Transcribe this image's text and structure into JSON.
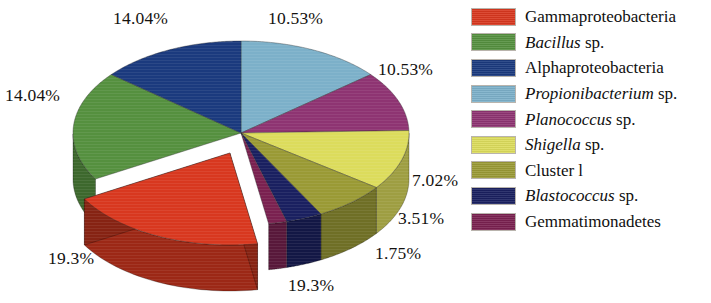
{
  "chart_data": {
    "type": "pie",
    "title": "",
    "subtitle": "",
    "xlabel": "",
    "ylabel": "",
    "three_d": true,
    "grid": false,
    "legend_position": "right",
    "exploded_slices": [
      "Gammaproteobacteria"
    ],
    "value_suffix": "%",
    "categories": [
      "Gammaproteobacteria",
      "Bacillus sp.",
      "Alphaproteobacteria",
      "Propionibacterium sp.",
      "Planococcus sp.",
      "Shigella sp.",
      "Cluster l",
      "Blastococcus sp.",
      "Gemmatimonadetes"
    ],
    "values": [
      19.3,
      19.3,
      14.04,
      14.04,
      10.53,
      10.53,
      7.02,
      3.51,
      1.75
    ],
    "colors": [
      "#d8381f",
      "#55903f",
      "#1b3a7e",
      "#7cb0c9",
      "#8e3472",
      "#dcdc5c",
      "#9a9a35",
      "#1a2060",
      "#7a2150"
    ],
    "data_labels": [
      "19.3%",
      "19.3%",
      "14.04%",
      "14.04%",
      "10.53%",
      "10.53%",
      "7.02%",
      "3.51%",
      "1.75%"
    ]
  },
  "pie": {
    "labels": [
      {
        "text": "14.04%",
        "left": 113,
        "top": 8
      },
      {
        "text": "10.53%",
        "left": 268,
        "top": 8
      },
      {
        "text": "10.53%",
        "left": 378,
        "top": 59
      },
      {
        "text": "14.04%",
        "left": 5,
        "top": 85
      },
      {
        "text": "7.02%",
        "left": 412,
        "top": 170
      },
      {
        "text": "3.51%",
        "left": 398,
        "top": 208
      },
      {
        "text": "1.75%",
        "left": 375,
        "top": 243
      },
      {
        "text": "19.3%",
        "left": 48,
        "top": 248
      },
      {
        "text": "19.3%",
        "left": 288,
        "top": 275
      }
    ]
  },
  "legend": {
    "items": [
      {
        "label_plain": "Gammaproteobacteria",
        "label_italic": "",
        "label_tail": "",
        "color": "#d8381f"
      },
      {
        "label_plain": "",
        "label_italic": "Bacillus",
        "label_tail": " sp.",
        "color": "#55903f"
      },
      {
        "label_plain": "Alphaproteobacteria",
        "label_italic": "",
        "label_tail": "",
        "color": "#1b3a7e"
      },
      {
        "label_plain": "",
        "label_italic": "Propionibacterium",
        "label_tail": " sp.",
        "color": "#7cb0c9"
      },
      {
        "label_plain": "",
        "label_italic": "Planococcus",
        "label_tail": " sp.",
        "color": "#8e3472"
      },
      {
        "label_plain": "",
        "label_italic": "Shigella",
        "label_tail": " sp.",
        "color": "#dcdc5c"
      },
      {
        "label_plain": "Cluster l",
        "label_italic": "",
        "label_tail": "",
        "color": "#9a9a35"
      },
      {
        "label_plain": "",
        "label_italic": "Blastococcus",
        "label_tail": " sp.",
        "color": "#1a2060"
      },
      {
        "label_plain": "Gemmatimonadetes",
        "label_italic": "",
        "label_tail": "",
        "color": "#7a2150"
      }
    ]
  }
}
